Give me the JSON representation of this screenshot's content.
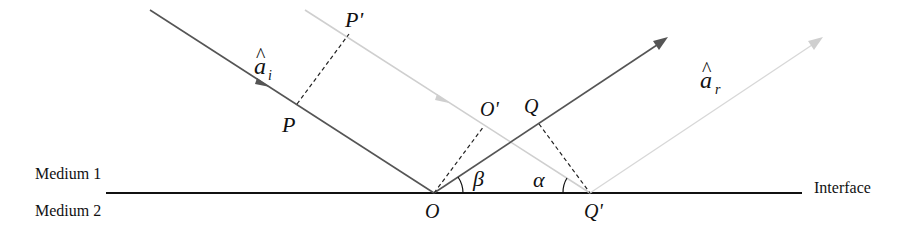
{
  "figure": {
    "colors": {
      "dark_ray": "#555555",
      "light_ray": "#cfcfcf",
      "interface": "#111111",
      "dashed": "#222222",
      "text": "#111111"
    },
    "labels": {
      "medium1": "Medium 1",
      "medium2": "Medium 2",
      "interface": "Interface",
      "incident_unit_vector": "a",
      "incident_subscript": "i",
      "incident_hat": "^",
      "reflected_unit_vector": "a",
      "reflected_subscript": "r",
      "reflected_hat": "^",
      "P": "P",
      "P_prime": "P'",
      "O": "O",
      "O_prime": "O'",
      "Q": "Q",
      "Q_prime": "Q'",
      "alpha": "α",
      "beta": "β"
    },
    "points": {
      "O": [
        434,
        193
      ],
      "Q_prime": [
        590,
        193
      ],
      "P": [
        297,
        104
      ],
      "P_prime": [
        349,
        34
      ],
      "O_prime": [
        484,
        126
      ],
      "Q": [
        539,
        124
      ]
    },
    "rays": [
      {
        "name": "incident-dark",
        "from": [
          150,
          10
        ],
        "to": [
          434,
          193
        ],
        "color": "dark"
      },
      {
        "name": "incident-light",
        "from": [
          305,
          10
        ],
        "to": [
          590,
          193
        ],
        "color": "light"
      },
      {
        "name": "reflected-dark",
        "from": [
          434,
          193
        ],
        "to": [
          667,
          38
        ],
        "color": "dark"
      },
      {
        "name": "reflected-light",
        "from": [
          590,
          193
        ],
        "to": [
          822,
          38
        ],
        "color": "light"
      }
    ],
    "interface_line": {
      "x1": 106,
      "x2": 802,
      "y": 193
    }
  }
}
